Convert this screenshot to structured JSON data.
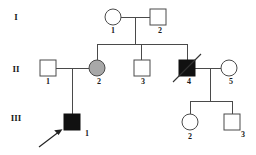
{
  "figure": {
    "kind": "pedigree-chart",
    "title": "",
    "caption": ""
  },
  "colors": {
    "background": "#ffffff",
    "line": "#4a4a4a",
    "unaffected_fill": "#ffffff",
    "carrier_fill": "#a8a8a8",
    "affected_fill": "#111111",
    "text": "#1a1a1a"
  },
  "generations": [
    {
      "numeral": "I",
      "y": 18
    },
    {
      "numeral": "II",
      "y": 70
    },
    {
      "numeral": "III",
      "y": 118
    }
  ],
  "individuals": [
    {
      "generation": "I",
      "id": "1",
      "shape": "circle",
      "status": "unaffected",
      "deceased": false,
      "proband": false,
      "cx": 113,
      "cy": 17,
      "r": 8,
      "label_x": 113,
      "label_y": 31
    },
    {
      "generation": "I",
      "id": "2",
      "shape": "square",
      "status": "unaffected",
      "deceased": false,
      "proband": false,
      "cx": 158,
      "cy": 17,
      "r": 8,
      "label_x": 158,
      "label_y": 31
    },
    {
      "generation": "II",
      "id": "1",
      "shape": "square",
      "status": "unaffected",
      "deceased": false,
      "proband": false,
      "cx": 48,
      "cy": 68,
      "r": 8,
      "label_x": 48,
      "label_y": 82
    },
    {
      "generation": "II",
      "id": "2",
      "shape": "circle",
      "status": "carrier",
      "deceased": false,
      "proband": false,
      "cx": 97,
      "cy": 68,
      "r": 8,
      "label_x": 97,
      "label_y": 82
    },
    {
      "generation": "II",
      "id": "3",
      "shape": "square",
      "status": "unaffected",
      "deceased": false,
      "proband": false,
      "cx": 141,
      "cy": 68,
      "r": 8,
      "label_x": 141,
      "label_y": 82
    },
    {
      "generation": "II",
      "id": "4",
      "shape": "square",
      "status": "affected",
      "deceased": true,
      "proband": false,
      "cx": 187,
      "cy": 68,
      "r": 8,
      "label_x": 187,
      "label_y": 82
    },
    {
      "generation": "II",
      "id": "5",
      "shape": "circle",
      "status": "unaffected",
      "deceased": false,
      "proband": false,
      "cx": 229,
      "cy": 68,
      "r": 8,
      "label_x": 229,
      "label_y": 82
    },
    {
      "generation": "III",
      "id": "1",
      "shape": "square",
      "status": "affected",
      "deceased": false,
      "proband": true,
      "cx": 72,
      "cy": 122,
      "r": 8,
      "label_x": 86,
      "label_y": 133
    },
    {
      "generation": "III",
      "id": "2",
      "shape": "circle",
      "status": "unaffected",
      "deceased": false,
      "proband": false,
      "cx": 190,
      "cy": 122,
      "r": 8,
      "label_x": 190,
      "label_y": 136
    },
    {
      "generation": "III",
      "id": "3",
      "shape": "square",
      "status": "unaffected",
      "deceased": false,
      "proband": false,
      "cx": 232,
      "cy": 122,
      "r": 8,
      "label_x": 232,
      "label_y": 136
    }
  ],
  "legend": {
    "circle_meaning": "female",
    "square_meaning": "male",
    "filled_meaning": "affected",
    "shaded_meaning": "carrier",
    "slash_meaning": "deceased",
    "arrow_meaning": "proband"
  },
  "gen_labels": {
    "g1": "I",
    "g2": "II",
    "g3": "III"
  },
  "ids": {
    "i1": "1",
    "i2": "2",
    "ii1": "1",
    "ii2": "2",
    "ii3": "3",
    "ii4": "4",
    "ii5": "5",
    "iii1": "1",
    "iii2": "2",
    "iii3": "3"
  }
}
